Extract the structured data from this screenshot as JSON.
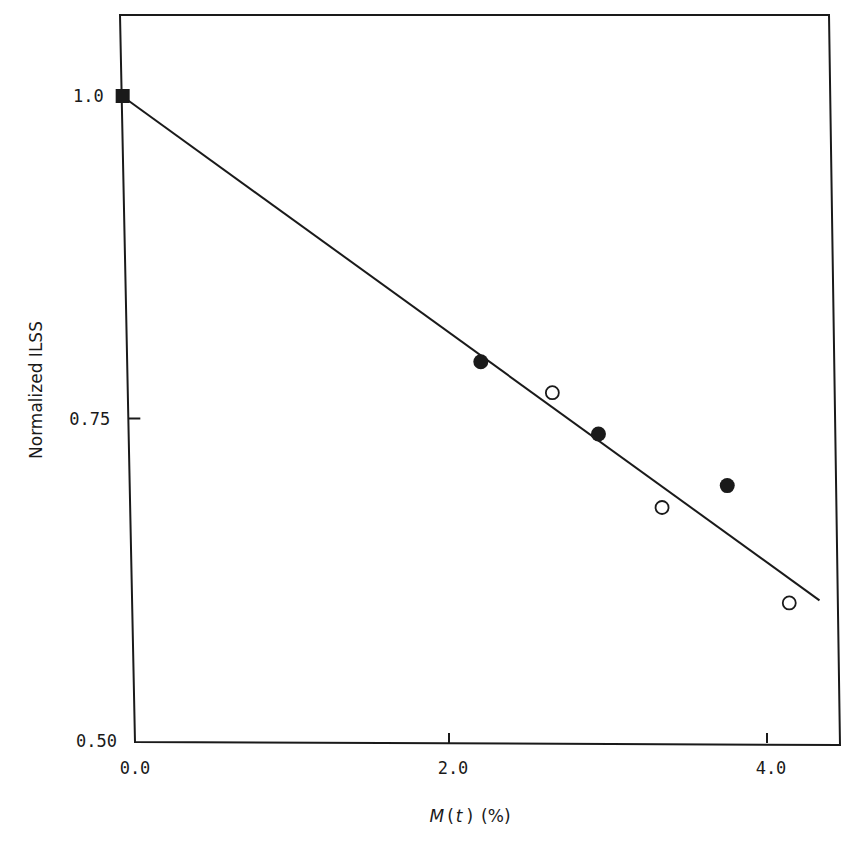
{
  "chart_data": {
    "type": "scatter",
    "title": "",
    "xlabel": "M(t) (%)",
    "xlabel_parts": {
      "var": "M",
      "open": "(",
      "arg": "t",
      "close": ")",
      "unit": "(%)"
    },
    "ylabel": "Normalized ILSS",
    "xlim": [
      0.0,
      4.35
    ],
    "ylim": [
      0.5,
      1.05
    ],
    "x_ticks": [
      {
        "value": 0.0,
        "label": "0.0"
      },
      {
        "value": 2.0,
        "label": "2.0"
      },
      {
        "value": 4.0,
        "label": "4.0"
      }
    ],
    "y_ticks": [
      {
        "value": 1.0,
        "label": "1.0"
      },
      {
        "value": 0.75,
        "label": "0.75"
      },
      {
        "value": 0.5,
        "label": "0.50"
      }
    ],
    "grid": false,
    "legend": null,
    "series": [
      {
        "name": "reference (dry)",
        "marker": "filled-square",
        "points": [
          {
            "x": 0.0,
            "y": 1.0
          }
        ]
      },
      {
        "name": "filled circles",
        "marker": "filled-circle",
        "points": [
          {
            "x": 2.2,
            "y": 0.794
          },
          {
            "x": 2.94,
            "y": 0.738
          },
          {
            "x": 3.75,
            "y": 0.698
          }
        ]
      },
      {
        "name": "open circles",
        "marker": "open-circle",
        "points": [
          {
            "x": 2.65,
            "y": 0.77
          },
          {
            "x": 3.34,
            "y": 0.681
          },
          {
            "x": 4.14,
            "y": 0.607
          }
        ]
      }
    ],
    "fit_line": {
      "type": "linear",
      "from": {
        "x": 0.0,
        "y": 1.0
      },
      "to": {
        "x": 4.33,
        "y": 0.609
      }
    },
    "colors": {
      "ink": "#1a1a1a",
      "background": "#ffffff"
    }
  }
}
